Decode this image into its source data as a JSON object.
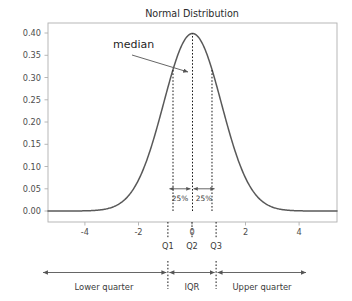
{
  "chart_data": {
    "type": "line",
    "title": "Normal Distribution",
    "xlabel": "",
    "ylabel": "",
    "grid": false,
    "legend": "none",
    "xlim": [
      -5,
      5
    ],
    "ylim": [
      0,
      0.41
    ],
    "distribution": {
      "name": "normal",
      "mean": 0,
      "sd": 1,
      "peak_value": 0.3989
    },
    "x_ticks": [
      "-4",
      "-2",
      "0",
      "2",
      "4"
    ],
    "x_tick_values": [
      -4,
      -2,
      0,
      2,
      4
    ],
    "y_ticks": [
      "0.00",
      "0.05",
      "0.10",
      "0.15",
      "0.20",
      "0.25",
      "0.30",
      "0.35",
      "0.40"
    ],
    "y_tick_values": [
      0.0,
      0.05,
      0.1,
      0.15,
      0.2,
      0.25,
      0.3,
      0.35,
      0.4
    ],
    "series": [
      {
        "name": "normal pdf",
        "color": "#595959",
        "x": [
          -5.0,
          -4.6,
          -4.2,
          -3.8,
          -3.4,
          -3.0,
          -2.6,
          -2.2,
          -1.8,
          -1.4,
          -1.0,
          -0.6,
          -0.2,
          0.2,
          0.6,
          1.0,
          1.4,
          1.8,
          2.2,
          2.6,
          3.0,
          3.4,
          3.8,
          4.2,
          4.6,
          5.0
        ],
        "y": [
          1.5e-06,
          1.02e-05,
          5.89e-05,
          0.0002919,
          0.0012322,
          0.0044318,
          0.013583,
          0.0354746,
          0.0789502,
          0.1497276,
          0.2419707,
          0.3332246,
          0.3910427,
          0.3910427,
          0.3332246,
          0.2419707,
          0.1497276,
          0.0789502,
          0.0354746,
          0.013583,
          0.0044318,
          0.0012322,
          0.0002919,
          5.89e-05,
          1.02e-05,
          1.5e-06
        ]
      }
    ],
    "quartile_lines": [
      {
        "label": "Q1",
        "x": -0.6745,
        "y_top": 0.3178
      },
      {
        "label": "Q2",
        "x": 0.0,
        "y_top": 0.3989
      },
      {
        "label": "Q3",
        "x": 0.6745,
        "y_top": 0.3178
      }
    ],
    "annotations": {
      "median_label": "median",
      "pct_left": "25%",
      "pct_right": "25%",
      "pct_arrow_y": 0.05,
      "lower_quarter": "Lower quarter",
      "iqr": "IQR",
      "upper_quarter": "Upper quarter"
    },
    "colors": {
      "curve": "#595959",
      "axis": "#b0b0b0",
      "tick_text": "#4d4d4d",
      "annotation": "#3a3a3a",
      "dotted": "#1a1a1a",
      "background": "#ffffff"
    }
  }
}
